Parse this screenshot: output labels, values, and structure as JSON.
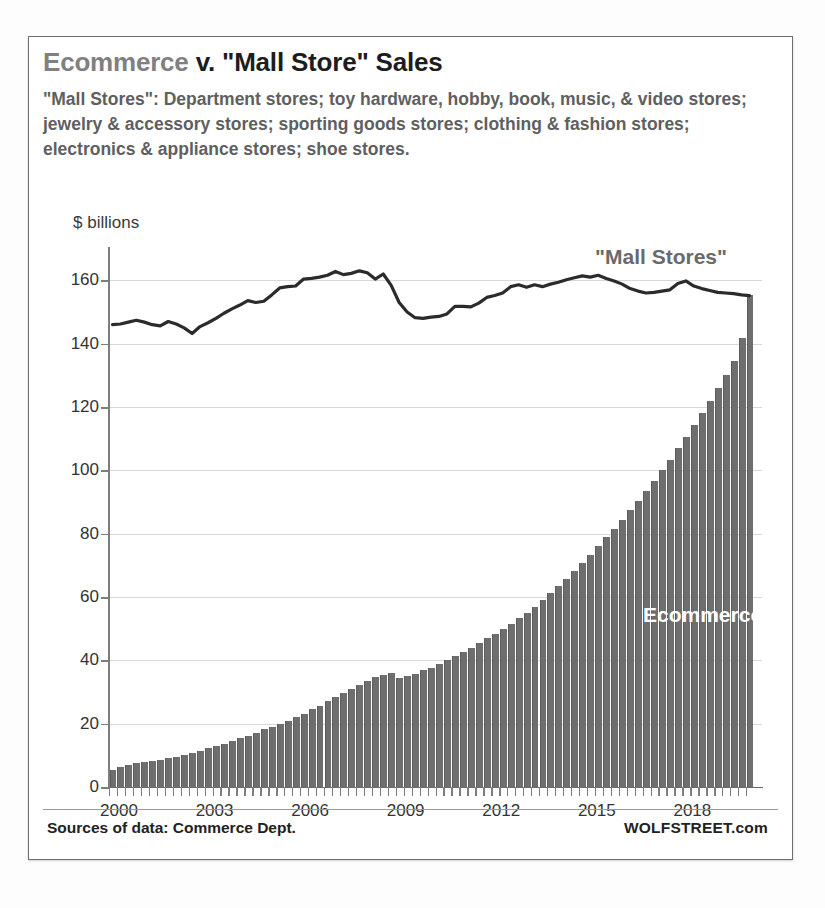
{
  "title": {
    "part_gray": "Ecommerce",
    "part_dark": " v. \"Mall Store\" Sales"
  },
  "subtitle": "\"Mall Stores\": Department stores; toy hardware, hobby, book, music, & video stores; jewelry & accessory stores; sporting goods stores; clothing & fashion stores; electronics & appliance stores; shoe stores.",
  "footer": {
    "source": "Sources of data: Commerce Dept.",
    "brand": "WOLFSTREET.com"
  },
  "colors": {
    "bar_fill": "#6e6e6e",
    "line_stroke": "#2b2b2b",
    "gridline": "#d7d7d7",
    "title_gray": "#808080",
    "title_dark": "#1d1d1d",
    "subtitle_gray": "#5f5f5f",
    "ecommerce_label": "#ffffff",
    "mall_label": "#6a6a6a",
    "card_border": "#6f6f6f"
  },
  "chart_data": {
    "type": "bar",
    "title": "Ecommerce v. \"Mall Store\" Sales",
    "xlabel": "",
    "ylabel": "$ billions",
    "ylim": [
      0,
      168
    ],
    "ytick_values": [
      0,
      20,
      40,
      60,
      80,
      100,
      120,
      140,
      160
    ],
    "ytick_labels": [
      "0",
      "20",
      "40",
      "60",
      "80",
      "100",
      "120",
      "140",
      "160"
    ],
    "xtick_values": [
      2000,
      2003,
      2006,
      2009,
      2012,
      2015,
      2018
    ],
    "xtick_labels": [
      "2000",
      "2003",
      "2006",
      "2009",
      "2012",
      "2015",
      "2018"
    ],
    "xlim": [
      2000.0,
      2020.5
    ],
    "grid": "horizontal",
    "legend": "inline-annotations",
    "frequency": "quarterly",
    "x": [
      2000.0,
      2000.25,
      2000.5,
      2000.75,
      2001.0,
      2001.25,
      2001.5,
      2001.75,
      2002.0,
      2002.25,
      2002.5,
      2002.75,
      2003.0,
      2003.25,
      2003.5,
      2003.75,
      2004.0,
      2004.25,
      2004.5,
      2004.75,
      2005.0,
      2005.25,
      2005.5,
      2005.75,
      2006.0,
      2006.25,
      2006.5,
      2006.75,
      2007.0,
      2007.25,
      2007.5,
      2007.75,
      2008.0,
      2008.25,
      2008.5,
      2008.75,
      2009.0,
      2009.25,
      2009.5,
      2009.75,
      2010.0,
      2010.25,
      2010.5,
      2010.75,
      2011.0,
      2011.25,
      2011.5,
      2011.75,
      2012.0,
      2012.25,
      2012.5,
      2012.75,
      2013.0,
      2013.25,
      2013.5,
      2013.75,
      2014.0,
      2014.25,
      2014.5,
      2014.75,
      2015.0,
      2015.25,
      2015.5,
      2015.75,
      2016.0,
      2016.25,
      2016.5,
      2016.75,
      2017.0,
      2017.25,
      2017.5,
      2017.75,
      2018.0,
      2018.25,
      2018.5,
      2018.75,
      2019.0,
      2019.25,
      2019.5,
      2019.75,
      2020.0
    ],
    "series": [
      {
        "name": "Ecommerce",
        "type": "bar",
        "color": "#6e6e6e",
        "label_position": "inside-right",
        "values": [
          5.5,
          6.2,
          6.8,
          7.5,
          8.0,
          8.3,
          8.6,
          9.2,
          9.6,
          10.2,
          10.8,
          11.5,
          12.2,
          13.0,
          13.7,
          14.6,
          15.4,
          16.2,
          17.1,
          18.2,
          19.0,
          20.0,
          21.0,
          22.2,
          23.2,
          24.5,
          25.7,
          27.2,
          28.4,
          29.8,
          31.0,
          32.2,
          33.4,
          34.6,
          35.4,
          36.0,
          34.4,
          35.0,
          35.8,
          36.8,
          37.6,
          38.8,
          40.0,
          41.4,
          42.6,
          44.0,
          45.4,
          47.0,
          48.4,
          50.0,
          51.6,
          53.4,
          55.0,
          57.0,
          59.0,
          61.2,
          63.4,
          65.8,
          68.2,
          70.8,
          73.2,
          76.0,
          78.8,
          81.6,
          84.4,
          87.4,
          90.4,
          93.6,
          96.6,
          100.0,
          103.4,
          107.0,
          110.4,
          114.2,
          118.0,
          122.0,
          126.0,
          130.2,
          134.6,
          141.8,
          155.5
        ]
      },
      {
        "name": "\"Mall Stores\"",
        "type": "line",
        "color": "#2b2b2b",
        "label_position": "above-line",
        "values": [
          146.0,
          146.2,
          146.8,
          147.4,
          146.8,
          146.0,
          145.6,
          147.0,
          146.2,
          145.0,
          143.2,
          145.4,
          146.6,
          148.0,
          149.6,
          151.0,
          152.2,
          153.6,
          153.0,
          153.4,
          155.4,
          157.6,
          158.0,
          158.2,
          160.4,
          160.6,
          161.0,
          161.6,
          162.8,
          161.8,
          162.2,
          163.0,
          162.4,
          160.4,
          162.0,
          158.4,
          153.0,
          150.0,
          148.2,
          148.0,
          148.4,
          148.6,
          149.4,
          151.8,
          151.8,
          151.6,
          152.8,
          154.6,
          155.2,
          156.0,
          158.0,
          158.6,
          157.8,
          158.6,
          158.0,
          158.8,
          159.4,
          160.2,
          160.8,
          161.4,
          161.0,
          161.6,
          160.6,
          159.8,
          158.8,
          157.4,
          156.6,
          156.0,
          156.2,
          156.6,
          157.0,
          159.0,
          159.8,
          158.2,
          157.4,
          156.8,
          156.2,
          156.0,
          155.8,
          155.4,
          155.2
        ]
      }
    ]
  }
}
